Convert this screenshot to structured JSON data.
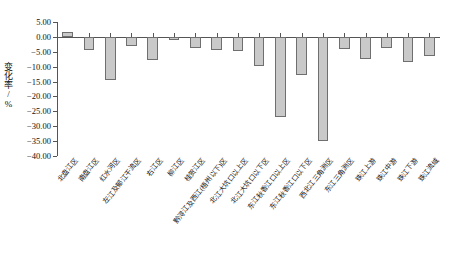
{
  "chart_data": {
    "type": "bar",
    "title": "",
    "xlabel": "",
    "ylabel": "变化率/%",
    "ylim": [
      -40.0,
      5.0
    ],
    "yticks": [
      "5.00",
      "0.00",
      "-5.00",
      "-10.00",
      "-15.00",
      "-20.00",
      "-25.00",
      "-30.00",
      "-35.00",
      "-40.00"
    ],
    "ytick_values": [
      5.0,
      0.0,
      -5.0,
      -10.0,
      -15.0,
      -20.0,
      -25.0,
      -30.0,
      -35.0,
      -40.0
    ],
    "grid": false,
    "legend": null,
    "bar_color": "#c9c9c9",
    "bar_border_color": "#6f6f6f",
    "categories": [
      "北盘江区",
      "南盘江区",
      "红水河区",
      "左江及郁江干流区",
      "右江区",
      "柳江区",
      "桂贺江区",
      "黔浔江及西江(梧州以下)区",
      "北江大坑口以上区",
      "北江大坑口以下区",
      "东江秋香江口以上区",
      "东江秋香江口以下区",
      "西北江三角洲区",
      "东江三角洲区",
      "珠江上游",
      "珠江中游",
      "珠江下游",
      "珠江流域"
    ],
    "values": [
      1.8,
      -4.3,
      -14.6,
      -3.0,
      -7.8,
      -1.2,
      -3.8,
      -4.5,
      -4.8,
      -9.8,
      -26.9,
      -12.8,
      -35.0,
      -4.0,
      -7.4,
      -3.9,
      -8.5,
      -6.3
    ]
  }
}
